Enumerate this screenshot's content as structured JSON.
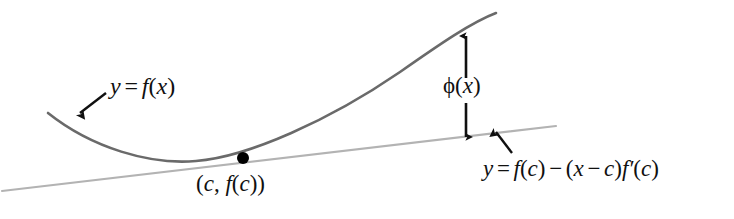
{
  "figure": {
    "background_color": "#ffffff",
    "width": 734,
    "height": 219,
    "curve_color": "#6a6a6a",
    "tangent_color": "#b3b3b3",
    "annotation_color": "#101010",
    "point_color": "#000000"
  },
  "labels": {
    "curve": {
      "y": "y",
      "equals": "=",
      "f": "f",
      "open": "(",
      "x": "x",
      "close": ")"
    },
    "phi": {
      "phi": "ϕ",
      "open": "(",
      "x": "x",
      "close": ")"
    },
    "point": {
      "open": "(",
      "c": "c",
      "comma": ",",
      "f": "f",
      "inner_open": "(",
      "inner_c": "c",
      "inner_close": ")",
      "close": ")"
    },
    "tangent": {
      "y": "y",
      "equals": "=",
      "f1": "f",
      "open1": "(",
      "c1": "c",
      "close1": ")",
      "minus": "−",
      "open2": "(",
      "x": "x",
      "minus2": "−",
      "c2": "c",
      "close2": ")",
      "f2": "f",
      "prime": "′",
      "open3": "(",
      "c3": "c",
      "close3": ")"
    }
  },
  "geometry": {
    "curve_path": "M 48,113 C 92,148 150,165 196,161 C 248,157 330,120 400,72 C 440,44 472,22 496,13",
    "tangent_path": "M 2,191 L 556,126",
    "tangent_point": {
      "x": 243,
      "y": 158,
      "radius": 6
    },
    "phi_arrow": {
      "x": 466,
      "y_top": 36,
      "y_bottom": 137
    },
    "curve_pointer": {
      "x1": 106,
      "y1": 93,
      "x2": 80,
      "y2": 113
    },
    "tangent_pointer": {
      "x1": 512,
      "y1": 153,
      "x2": 496,
      "y2": 132
    }
  },
  "chart_data": {
    "type": "line",
    "xlabel": "x",
    "ylabel": "y",
    "grid": false,
    "legend": "none",
    "annotations": [
      "y = f(x)",
      "ϕ(x)",
      "(c, f(c))",
      "y = f(c) − (x − c)f′(c)"
    ],
    "series": [
      {
        "name": "y = f(x)",
        "style": "solid",
        "color": "#6a6a6a",
        "description": "convex curve with minimum left of the tangency point, rising steeply to the right"
      },
      {
        "name": "y = f(c) − (x − c)f′(c)",
        "style": "solid-thin",
        "color": "#b3b3b3",
        "description": "straight line touching the curve at (c, f(c))"
      }
    ],
    "markers": [
      {
        "label": "(c, f(c))",
        "note": "point of tangency"
      }
    ],
    "measures": [
      {
        "label": "ϕ(x)",
        "note": "vertical gap between the curve and the tangent line",
        "type": "double-arrow"
      }
    ]
  }
}
